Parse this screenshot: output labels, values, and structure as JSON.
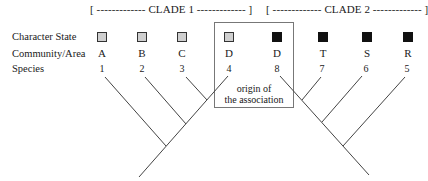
{
  "clades": [
    {
      "label": "[ ------------- CLADE 1 ------------- ]"
    },
    {
      "label": "[ ------------- CLADE 2 ------------- ]"
    }
  ],
  "row_labels": {
    "character_state": "Character State",
    "community_area": "Community/Area",
    "species": "Species"
  },
  "taxa": [
    {
      "character_state": "stippled",
      "community": "A",
      "species": "1"
    },
    {
      "character_state": "stippled",
      "community": "B",
      "species": "2"
    },
    {
      "character_state": "stippled",
      "community": "C",
      "species": "3"
    },
    {
      "character_state": "stippled",
      "community": "D",
      "species": "4"
    },
    {
      "character_state": "filled",
      "community": "D",
      "species": "8"
    },
    {
      "character_state": "filled",
      "community": "T",
      "species": "7"
    },
    {
      "character_state": "filled",
      "community": "S",
      "species": "6"
    },
    {
      "character_state": "filled",
      "community": "R",
      "species": "5"
    }
  ],
  "annotation": {
    "line1": "origin of",
    "line2": "the association"
  },
  "colors": {
    "line": "#444444",
    "filled": "#111111",
    "stippled": "#cfcfcf",
    "box_border": "#777777"
  }
}
